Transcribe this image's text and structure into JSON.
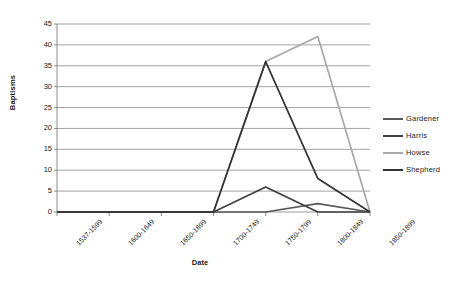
{
  "chart_data": {
    "type": "line",
    "title": "",
    "xlabel": "Date",
    "ylabel": "Baptisms",
    "categories": [
      "1537-1599",
      "1600-1649",
      "1650-1699",
      "1700-1749",
      "1750-1799",
      "1800-1849",
      "1850-1899"
    ],
    "yticks": [
      0,
      5,
      10,
      15,
      20,
      25,
      30,
      35,
      40,
      45
    ],
    "ylim": [
      0,
      45
    ],
    "grid": "horizontal",
    "legend_position": "right",
    "series": [
      {
        "name": "Gardener",
        "color": "#5a5a5a",
        "values": [
          0,
          0,
          0,
          0,
          0,
          2,
          0
        ]
      },
      {
        "name": "Harris",
        "color": "#3f3f3f",
        "values": [
          0,
          0,
          0,
          0,
          6,
          0,
          0
        ]
      },
      {
        "name": "Howse",
        "color": "#a8a8a8",
        "values": [
          0,
          0,
          0,
          0,
          36,
          42,
          0
        ]
      },
      {
        "name": "Shepherd",
        "color": "#333333",
        "values": [
          0,
          0,
          0,
          0,
          36,
          8,
          0
        ]
      }
    ]
  },
  "axis": {
    "y_title": "Baptisms",
    "x_title": "Date",
    "tick_labels_y": [
      "45",
      "40",
      "35",
      "30",
      "25",
      "20",
      "15",
      "10",
      "5",
      "0"
    ],
    "tick_labels_x": [
      "1537-1599",
      "1600-1649",
      "1650-1699",
      "1700-1749",
      "1750-1799",
      "1800-1849",
      "1850-1899"
    ]
  },
  "legend": {
    "items": [
      {
        "label": "Gardener"
      },
      {
        "label": "Harris"
      },
      {
        "label": "Howse"
      },
      {
        "label": "Shepherd"
      }
    ]
  }
}
